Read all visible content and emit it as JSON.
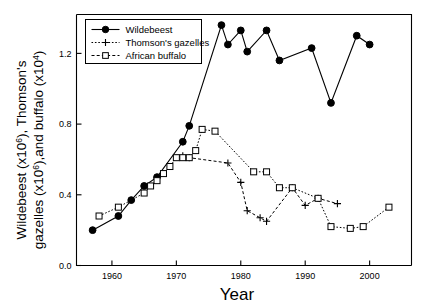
{
  "figure": {
    "background": "#ffffff",
    "ink": "#000000"
  },
  "chart_data": {
    "type": "line",
    "title": "",
    "xlabel": "Year",
    "ylabel_line1": "Wildebeest (x106), Thomson's",
    "ylabel_line2": "gazelles (x106),and buffalo (x104)",
    "ylabel_line1_parts": {
      "a": "Wildebeest (x10",
      "a_sup": "6",
      "b": "), Thomson's"
    },
    "ylabel_line2_parts": {
      "a": "gazelles (x10",
      "a_sup": "6",
      "b": "),and buffalo (x10",
      "b_sup": "4",
      "c": ")"
    },
    "xlim": [
      1954.5,
      2006.5
    ],
    "ylim": [
      0.0,
      1.42
    ],
    "xticks": [
      1960,
      1970,
      1980,
      1990,
      2000
    ],
    "xtick_labels": [
      "1960",
      "1970",
      "1980",
      "1990",
      "2000"
    ],
    "yticks": [
      0.0,
      0.4,
      0.8,
      1.2
    ],
    "ytick_labels": [
      "0.0",
      "0.4",
      "0.8",
      "1.2"
    ],
    "grid": false,
    "legend_position": "top-left",
    "series": [
      {
        "name": "Wildebeest",
        "marker": "filled-circle",
        "linestyle": "solid",
        "color": "#000000",
        "x": [
          1957,
          1961,
          1963,
          1965,
          1967,
          1971,
          1972,
          1977,
          1978,
          1980,
          1981,
          1984,
          1986,
          1991,
          1994,
          1998,
          2000
        ],
        "y": [
          0.2,
          0.28,
          0.37,
          0.45,
          0.5,
          0.7,
          0.79,
          1.36,
          1.25,
          1.33,
          1.21,
          1.33,
          1.16,
          1.23,
          0.92,
          1.3,
          1.25
        ]
      },
      {
        "name": "Thomson's gazelles",
        "marker": "plus",
        "linestyle": "dashed",
        "color": "#000000",
        "x": [
          1971,
          1972,
          1978,
          1980,
          1981,
          1983,
          1984,
          1988,
          1990,
          1992,
          1995
        ],
        "y": [
          0.62,
          0.61,
          0.58,
          0.47,
          0.31,
          0.27,
          0.25,
          0.44,
          0.34,
          0.38,
          0.35
        ]
      },
      {
        "name": "African buffalo",
        "marker": "open-square",
        "linestyle": "dotted",
        "color": "#000000",
        "x": [
          1958,
          1961,
          1965,
          1966,
          1967,
          1968,
          1969,
          1970,
          1971,
          1972,
          1973,
          1974,
          1976,
          1982,
          1984,
          1986,
          1988,
          1992,
          1994,
          1997,
          1999,
          2003
        ],
        "y": [
          0.28,
          0.33,
          0.41,
          0.45,
          0.48,
          0.52,
          0.56,
          0.61,
          0.61,
          0.61,
          0.65,
          0.77,
          0.76,
          0.53,
          0.53,
          0.44,
          0.44,
          0.38,
          0.22,
          0.21,
          0.22,
          0.33
        ]
      }
    ],
    "legend_entries": [
      {
        "label": "Wildebeest",
        "marker": "filled-circle",
        "linestyle": "solid"
      },
      {
        "label": "Thomson's gazelles",
        "marker": "plus",
        "linestyle": "dotted"
      },
      {
        "label": "African buffalo",
        "marker": "open-square",
        "linestyle": "dashed"
      }
    ]
  }
}
